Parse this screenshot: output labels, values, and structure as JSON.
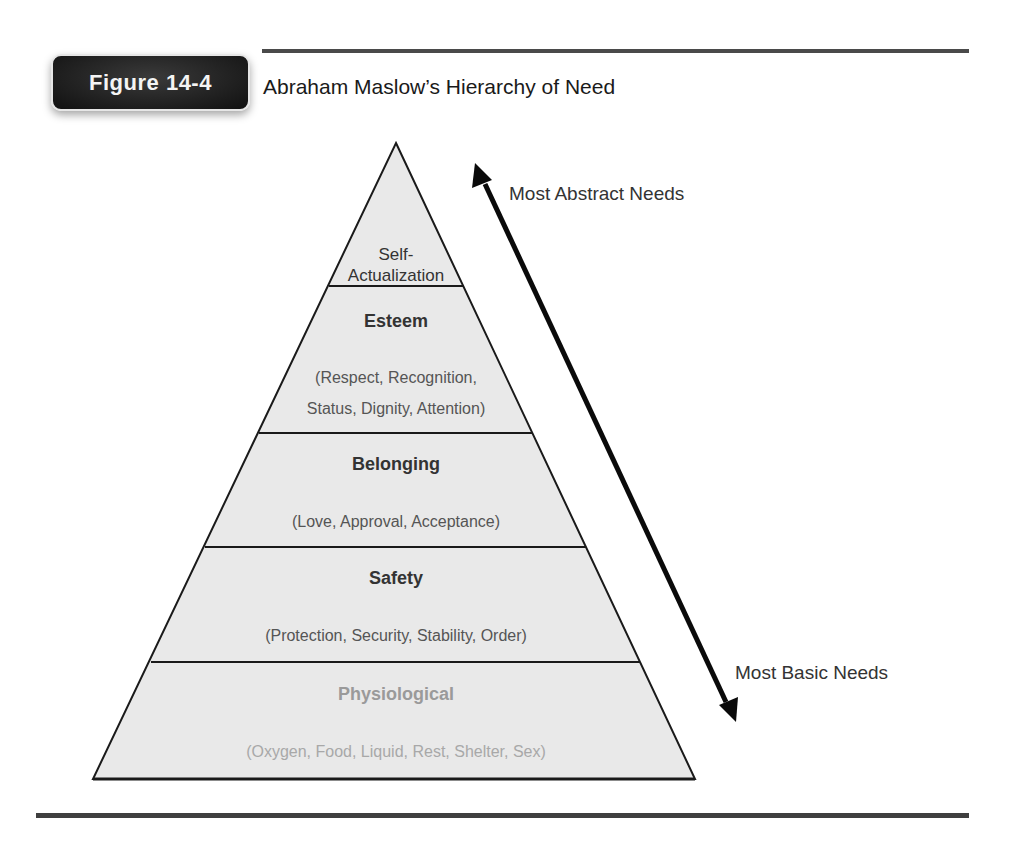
{
  "figure": {
    "badge": "Figure 14-4",
    "title": "Abraham Maslow’s Hierarchy of Need"
  },
  "pyramid": {
    "fill_color": "#e9e9e9",
    "stroke_color": "#1a1a1a",
    "levels": [
      {
        "name": "Self-Actualization",
        "title_line1": "Self-",
        "title_line2": "Actualization",
        "description": ""
      },
      {
        "name": "Esteem",
        "title": "Esteem",
        "desc_line1": "(Respect, Recognition,",
        "desc_line2": "Status, Dignity, Attention)"
      },
      {
        "name": "Belonging",
        "title": "Belonging",
        "description": "(Love, Approval, Acceptance)"
      },
      {
        "name": "Safety",
        "title": "Safety",
        "description": "(Protection, Security, Stability, Order)"
      },
      {
        "name": "Physiological",
        "title": "Physiological",
        "description": "(Oxygen, Food, Liquid, Rest, Shelter, Sex)"
      }
    ]
  },
  "arrow": {
    "top_label": "Most Abstract Needs",
    "bottom_label": "Most Basic Needs"
  }
}
